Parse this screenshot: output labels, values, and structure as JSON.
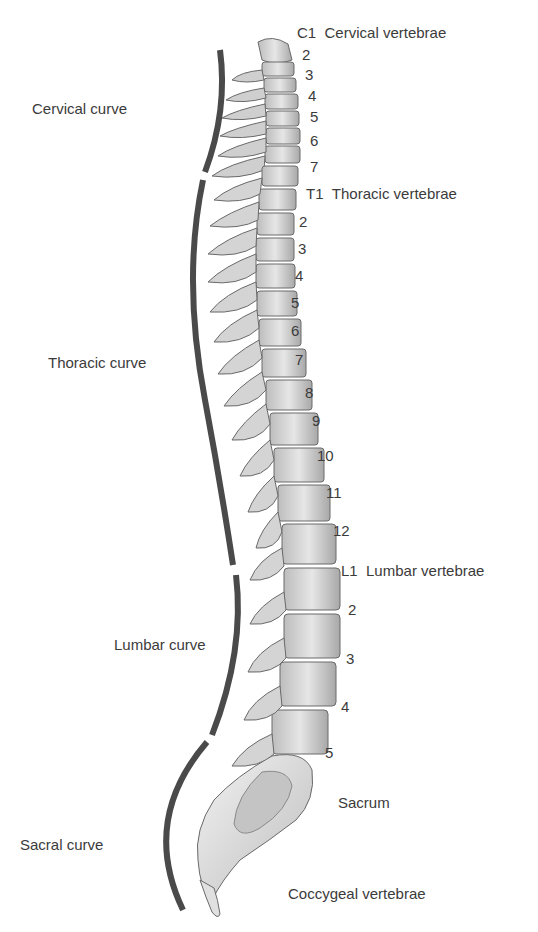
{
  "diagram": {
    "type": "anatomical-illustration",
    "curves": [
      {
        "id": "cervical",
        "label": "Cervical curve"
      },
      {
        "id": "thoracic",
        "label": "Thoracic curve"
      },
      {
        "id": "lumbar",
        "label": "Lumbar curve"
      },
      {
        "id": "sacral",
        "label": "Sacral curve"
      }
    ],
    "regions": {
      "cervical": {
        "first": "C1",
        "title": "Cervical vertebrae",
        "numbers": [
          "2",
          "3",
          "4",
          "5",
          "6",
          "7"
        ]
      },
      "thoracic": {
        "first": "T1",
        "title": "Thoracic vertebrae",
        "numbers": [
          "2",
          "3",
          "4",
          "5",
          "6",
          "7",
          "8",
          "9",
          "10",
          "11",
          "12"
        ]
      },
      "lumbar": {
        "first": "L1",
        "title": "Lumbar vertebrae",
        "numbers": [
          "2",
          "3",
          "4",
          "5"
        ]
      },
      "sacrum": {
        "title": "Sacrum"
      },
      "coccyx": {
        "title": "Coccygeal vertebrae"
      }
    },
    "colors": {
      "curve_bar": "#4a4a4a",
      "bone_fill": "#d9d9d9",
      "bone_shadow": "#9a9a9a",
      "text": "#3b3b3b"
    }
  }
}
